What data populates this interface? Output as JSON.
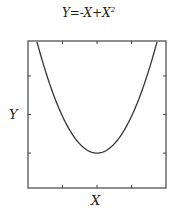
{
  "chart_data": {
    "type": "line",
    "title_parts": {
      "main": "Y=-X+X",
      "sup": "2"
    },
    "xlabel": "X",
    "ylabel": "Y",
    "xlim": [
      -1.5,
      2.5
    ],
    "ylim": [
      -1.2,
      2.8
    ],
    "grid": false,
    "legend": null,
    "x_ticks": [
      -0.5,
      0.5,
      1.5
    ],
    "y_ticks": [
      -0.25,
      0.8,
      1.85
    ],
    "tick_labels_shown": false,
    "series": [
      {
        "name": "Y=-X+X^2",
        "color": "#333333",
        "x": [
          -1.25,
          -1.0,
          -0.75,
          -0.5,
          -0.25,
          0.0,
          0.25,
          0.5,
          0.75,
          1.0,
          1.25,
          1.5,
          1.75,
          2.0,
          2.25
        ],
        "y": [
          2.8125,
          2.0,
          1.3125,
          0.75,
          0.3125,
          0.0,
          -0.1875,
          -0.25,
          -0.1875,
          0.0,
          0.3125,
          0.75,
          1.3125,
          2.0,
          2.8125
        ]
      }
    ]
  },
  "plot_box": {
    "left": 28,
    "top": 41,
    "right": 166,
    "bottom": 188
  }
}
